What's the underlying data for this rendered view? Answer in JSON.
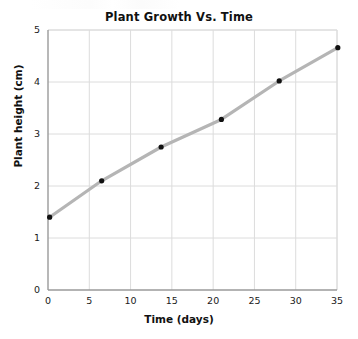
{
  "figure": {
    "title": "Plant Growth Vs. Time",
    "background_color": "#ffffff",
    "partial_text_artifact": ""
  },
  "chart_data": {
    "type": "line",
    "title": "Plant Growth Vs. Time",
    "subtitle": "",
    "xlabel": "Time (days)",
    "ylabel": "Plant height (cm)",
    "xlim": [
      0,
      35
    ],
    "ylim": [
      0,
      5
    ],
    "xticks": [
      0,
      5,
      10,
      15,
      20,
      25,
      30,
      35
    ],
    "xtick_labels": [
      "0",
      "5",
      "10",
      "15",
      "20",
      "25",
      "30",
      "35"
    ],
    "yticks": [
      0,
      1,
      2,
      3,
      4,
      5
    ],
    "ytick_labels": [
      "0",
      "1",
      "2",
      "3",
      "4",
      "5"
    ],
    "grid": true,
    "grid_color": "#dcdcdc",
    "axis_color": "#9a9a9a",
    "legend": null,
    "legend_position": "none",
    "series": [
      {
        "name": "Plant height",
        "line_color": "#b5b5b5",
        "marker_color": "#111111",
        "marker": "circle",
        "x": [
          0.2,
          6.5,
          13.7,
          21.0,
          28.0,
          35.1
        ],
        "y": [
          1.4,
          2.1,
          2.75,
          3.28,
          4.02,
          4.66
        ]
      }
    ],
    "annotations": []
  }
}
